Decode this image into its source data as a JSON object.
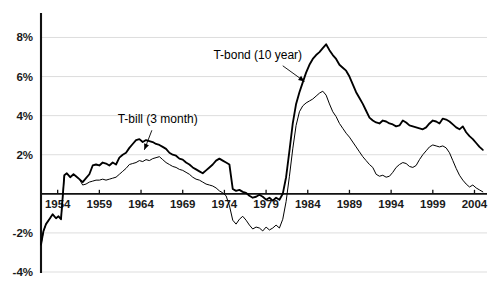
{
  "chart_data": {
    "type": "line",
    "title": "",
    "subtitle": "",
    "xlabel": "",
    "ylabel": "",
    "xlim": [
      1952.0,
      2005.5
    ],
    "ylim": [
      -4,
      9.2
    ],
    "grid": true,
    "legend_position": "inline-annotations",
    "y_tick_labels": [
      "8%",
      "6%",
      "4%",
      "2%",
      "-2%",
      "-4%"
    ],
    "y_tick_values": [
      8,
      6,
      4,
      2,
      -2,
      -4
    ],
    "x_tick_labels": [
      "1954",
      "1959",
      "1964",
      "1969",
      "1974",
      "1979",
      "1984",
      "1989",
      "1994",
      "1999",
      "2004"
    ],
    "x_tick_values": [
      1954,
      1959,
      1964,
      1969,
      1974,
      1979,
      1984,
      1989,
      1994,
      1999,
      2004
    ],
    "annotations": [
      {
        "text": "T-bond (10 year)",
        "series": "T-bond (10 year)",
        "x": 1978.0,
        "y": 6.9
      },
      {
        "text": "T-bill (3 month)",
        "series": "T-bill (3 month)",
        "x": 1966.0,
        "y": 3.6
      }
    ],
    "series": [
      {
        "name": "T-bond (10 year)",
        "color": "#000000",
        "linewidth": 1.85,
        "x": [
          1952.0,
          1952.3,
          1952.6,
          1953.0,
          1953.4,
          1953.8,
          1954.1,
          1954.4,
          1954.8,
          1955.1,
          1955.5,
          1955.9,
          1956.2,
          1956.6,
          1957.0,
          1957.4,
          1957.8,
          1958.2,
          1958.6,
          1959.0,
          1959.4,
          1959.8,
          1960.2,
          1960.6,
          1961.0,
          1961.4,
          1961.8,
          1962.2,
          1962.6,
          1963.0,
          1963.4,
          1963.8,
          1964.2,
          1964.6,
          1965.0,
          1965.4,
          1965.8,
          1966.2,
          1966.6,
          1967.0,
          1967.4,
          1967.8,
          1968.2,
          1968.6,
          1969.0,
          1969.4,
          1969.8,
          1970.2,
          1970.6,
          1971.0,
          1971.4,
          1971.8,
          1972.2,
          1972.6,
          1973.0,
          1973.4,
          1973.8,
          1974.2,
          1974.6,
          1975.0,
          1975.4,
          1975.8,
          1976.2,
          1976.6,
          1977.0,
          1977.4,
          1977.8,
          1978.2,
          1978.6,
          1979.0,
          1979.4,
          1979.8,
          1980.2,
          1980.6,
          1981.0,
          1981.4,
          1981.8,
          1982.2,
          1982.6,
          1983.0,
          1983.4,
          1983.8,
          1984.2,
          1984.6,
          1985.0,
          1985.4,
          1985.8,
          1986.2,
          1986.6,
          1987.0,
          1987.4,
          1987.8,
          1988.2,
          1988.6,
          1989.0,
          1989.4,
          1989.8,
          1990.2,
          1990.6,
          1991.0,
          1991.4,
          1991.8,
          1992.2,
          1992.6,
          1993.0,
          1993.4,
          1993.8,
          1994.2,
          1994.6,
          1995.0,
          1995.4,
          1995.8,
          1996.2,
          1996.6,
          1997.0,
          1997.4,
          1997.8,
          1998.2,
          1998.6,
          1999.0,
          1999.4,
          1999.8,
          2000.2,
          2000.6,
          2001.0,
          2001.4,
          2001.8,
          2002.2,
          2002.6,
          2003.0,
          2003.4,
          2003.8,
          2004.2,
          2004.6,
          2005.0
        ],
        "y": [
          -2.6,
          -1.9,
          -1.55,
          -1.3,
          -1.05,
          -1.25,
          -1.15,
          -1.3,
          0.95,
          1.05,
          0.85,
          1.0,
          0.9,
          0.75,
          0.6,
          0.8,
          1.0,
          1.45,
          1.5,
          1.45,
          1.6,
          1.55,
          1.45,
          1.6,
          1.5,
          1.85,
          2.0,
          2.1,
          2.35,
          2.55,
          2.75,
          2.8,
          2.65,
          2.75,
          2.7,
          2.65,
          2.55,
          2.5,
          2.4,
          2.3,
          2.1,
          2.0,
          1.95,
          1.8,
          1.75,
          1.6,
          1.5,
          1.35,
          1.25,
          1.15,
          1.05,
          1.2,
          1.35,
          1.5,
          1.7,
          1.8,
          1.7,
          1.6,
          1.5,
          0.25,
          0.15,
          0.2,
          0.1,
          0.05,
          -0.1,
          -0.2,
          -0.15,
          -0.05,
          -0.15,
          -0.3,
          -0.2,
          -0.35,
          -0.2,
          -0.3,
          0.0,
          0.85,
          2.2,
          3.6,
          4.6,
          5.2,
          5.7,
          6.2,
          6.6,
          6.9,
          7.1,
          7.25,
          7.45,
          7.65,
          7.35,
          7.1,
          6.9,
          6.6,
          6.45,
          6.3,
          6.0,
          5.6,
          5.2,
          4.9,
          4.6,
          4.25,
          3.9,
          3.75,
          3.65,
          3.6,
          3.75,
          3.7,
          3.6,
          3.55,
          3.45,
          3.5,
          3.75,
          3.65,
          3.5,
          3.45,
          3.4,
          3.35,
          3.3,
          3.4,
          3.6,
          3.75,
          3.7,
          3.6,
          3.85,
          3.8,
          3.7,
          3.55,
          3.4,
          3.3,
          3.45,
          3.15,
          2.95,
          2.8,
          2.6,
          2.4,
          2.25
        ]
      },
      {
        "name": "T-bill (3 month)",
        "color": "#000000",
        "linewidth": 1.0,
        "x": [
          1952.0,
          1952.3,
          1952.6,
          1953.0,
          1953.4,
          1953.8,
          1954.1,
          1954.4,
          1954.8,
          1955.1,
          1955.5,
          1955.9,
          1956.2,
          1956.6,
          1957.0,
          1957.4,
          1957.8,
          1958.2,
          1958.6,
          1959.0,
          1959.4,
          1959.8,
          1960.2,
          1960.6,
          1961.0,
          1961.4,
          1961.8,
          1962.2,
          1962.6,
          1963.0,
          1963.4,
          1963.8,
          1964.2,
          1964.6,
          1965.0,
          1965.4,
          1965.8,
          1966.2,
          1966.6,
          1967.0,
          1967.4,
          1967.8,
          1968.2,
          1968.6,
          1969.0,
          1969.4,
          1969.8,
          1970.2,
          1970.6,
          1971.0,
          1971.4,
          1971.8,
          1972.2,
          1972.6,
          1973.0,
          1973.4,
          1973.8,
          1974.2,
          1974.6,
          1975.0,
          1975.4,
          1975.8,
          1976.2,
          1976.6,
          1977.0,
          1977.4,
          1977.8,
          1978.2,
          1978.6,
          1979.0,
          1979.4,
          1979.8,
          1980.2,
          1980.6,
          1981.0,
          1981.4,
          1981.8,
          1982.2,
          1982.6,
          1983.0,
          1983.4,
          1983.8,
          1984.2,
          1984.6,
          1985.0,
          1985.4,
          1985.8,
          1986.2,
          1986.6,
          1987.0,
          1987.4,
          1987.8,
          1988.2,
          1988.6,
          1989.0,
          1989.4,
          1989.8,
          1990.2,
          1990.6,
          1991.0,
          1991.4,
          1991.8,
          1992.2,
          1992.6,
          1993.0,
          1993.4,
          1993.8,
          1994.2,
          1994.6,
          1995.0,
          1995.4,
          1995.8,
          1996.2,
          1996.6,
          1997.0,
          1997.4,
          1997.8,
          1998.2,
          1998.6,
          1999.0,
          1999.4,
          1999.8,
          2000.2,
          2000.6,
          2001.0,
          2001.4,
          2001.8,
          2002.2,
          2002.6,
          2003.0,
          2003.4,
          2003.8,
          2004.2,
          2004.6,
          2005.0
        ],
        "y": [
          -2.6,
          -1.9,
          -1.55,
          -1.3,
          -1.05,
          -1.25,
          -1.15,
          -1.3,
          0.95,
          1.05,
          0.85,
          1.0,
          0.9,
          0.75,
          0.45,
          0.5,
          0.6,
          0.65,
          0.7,
          0.7,
          0.75,
          0.7,
          0.75,
          0.8,
          0.85,
          1.0,
          1.15,
          1.3,
          1.5,
          1.55,
          1.6,
          1.7,
          1.65,
          1.75,
          1.7,
          1.8,
          1.85,
          1.9,
          1.75,
          1.6,
          1.5,
          1.4,
          1.35,
          1.25,
          1.2,
          1.1,
          1.0,
          0.85,
          0.75,
          0.7,
          0.6,
          0.5,
          0.45,
          0.4,
          0.3,
          0.15,
          0.05,
          -0.1,
          -0.6,
          -1.35,
          -1.55,
          -1.3,
          -1.15,
          -1.35,
          -1.6,
          -1.8,
          -1.7,
          -1.75,
          -1.9,
          -1.7,
          -1.85,
          -1.75,
          -1.6,
          -1.75,
          -1.3,
          -0.4,
          0.9,
          2.3,
          3.5,
          4.2,
          4.5,
          4.65,
          4.75,
          4.85,
          5.0,
          5.15,
          5.25,
          5.05,
          4.6,
          4.2,
          3.95,
          3.6,
          3.35,
          3.1,
          2.9,
          2.65,
          2.4,
          2.15,
          1.9,
          1.7,
          1.5,
          1.35,
          1.0,
          0.9,
          0.95,
          0.85,
          0.9,
          1.1,
          1.35,
          1.5,
          1.6,
          1.55,
          1.4,
          1.35,
          1.45,
          1.75,
          2.0,
          2.2,
          2.4,
          2.5,
          2.45,
          2.4,
          2.45,
          2.35,
          2.1,
          1.7,
          1.3,
          0.95,
          0.7,
          0.5,
          0.35,
          0.45,
          0.3,
          0.2,
          0.1
        ]
      }
    ]
  },
  "axis": {
    "y_axis_name": "percent-axis",
    "x_axis_name": "year-axis"
  }
}
